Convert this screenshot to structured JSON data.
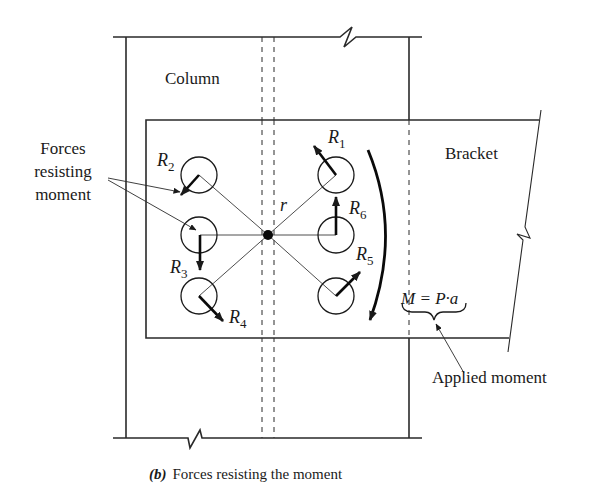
{
  "labels": {
    "column": "Column",
    "bracket": "Bracket",
    "forces_line1": "Forces",
    "forces_line2": "resisting",
    "forces_line3": "moment",
    "r": "r",
    "moment_eq": "M = P·a",
    "applied_moment": "Applied moment"
  },
  "forces": [
    {
      "name": "R",
      "sub": "1"
    },
    {
      "name": "R",
      "sub": "2"
    },
    {
      "name": "R",
      "sub": "3"
    },
    {
      "name": "R",
      "sub": "4"
    },
    {
      "name": "R",
      "sub": "5"
    },
    {
      "name": "R",
      "sub": "6"
    }
  ],
  "caption": {
    "tag": "(b)",
    "text": "Forces resisting the moment"
  },
  "colors": {
    "line": "#2a2a2a",
    "background": "#ffffff"
  }
}
